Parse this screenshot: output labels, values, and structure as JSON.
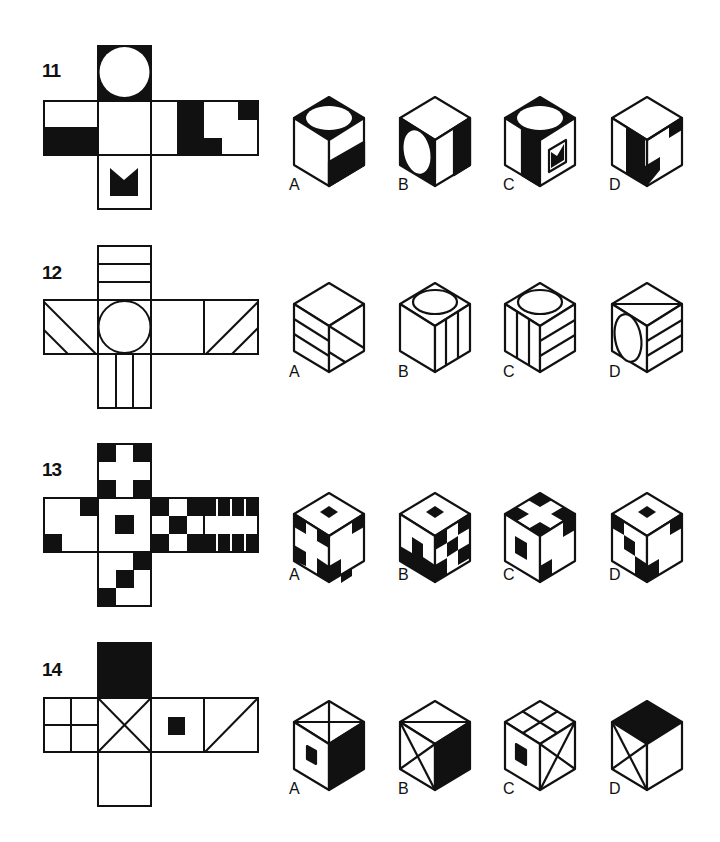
{
  "colors": {
    "ink": "#111111",
    "paper": "#ffffff"
  },
  "problems": [
    {
      "number": "11",
      "net_description": "Cross net: top face black with white circle; center blank; left face white top / black bottom; right-of-center blank; far right black L-shapes; bottom face with black M/crown shape",
      "options": [
        {
          "label": "A",
          "description": "Top: white ellipse on black; left: blank; right: white top / black bottom"
        },
        {
          "label": "B",
          "description": "Top: blank; left: white ellipse on black; right: white left / black right stripe"
        },
        {
          "label": "C",
          "description": "Top: white ellipse on black; left: white with black right stripe; right: black M shape"
        },
        {
          "label": "D",
          "description": "Top: blank; left: black stripe; right: black L-shapes"
        }
      ]
    },
    {
      "number": "12",
      "net_description": "Cross net: top face three horizontal bands; center circle; left face two diagonal lines; right-of-center blank; far right two diagonal lines; bottom face two vertical lines",
      "options": [
        {
          "label": "A",
          "description": "Top: blank; left: horizontal bands; right: diagonal lines"
        },
        {
          "label": "B",
          "description": "Top: ellipse; left: blank; right: vertical lines"
        },
        {
          "label": "C",
          "description": "Top: ellipse; left: vertical lines; right: horizontal-like bands"
        },
        {
          "label": "D",
          "description": "Top: diagonal line; left: ellipse; right: bands"
        }
      ]
    },
    {
      "number": "13",
      "net_description": "Cross net: top face white cross on black corners; center small black square; left face black corner squares; right-of-center checkerboard; far right vertical bars; bottom face staircase squares",
      "options": [
        {
          "label": "A",
          "description": "Top: small black diamond; left: white cross pattern; right: black corner shapes"
        },
        {
          "label": "B",
          "description": "Top: small black diamond; left: staircase; right: checkerboard"
        },
        {
          "label": "C",
          "description": "Top: white cross; left: black square; right: corner shapes"
        },
        {
          "label": "D",
          "description": "Top: small black diamond; left: staircase; right: corner shapes"
        }
      ]
    },
    {
      "number": "14",
      "net_description": "Cross net: top face solid black; center X; left face four quadrants; right-of-center small black square; far right single diagonal; bottom face blank",
      "options": [
        {
          "label": "A",
          "description": "Top: X; left: small black square; right: solid black"
        },
        {
          "label": "B",
          "description": "Top: single diagonal; left: X; right: solid black"
        },
        {
          "label": "C",
          "description": "Top: quadrants; left: small black square; right: X"
        },
        {
          "label": "D",
          "description": "Top: solid black; left: X; right: blank"
        }
      ]
    }
  ]
}
